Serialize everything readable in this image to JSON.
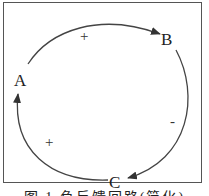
{
  "diagram": {
    "type": "causal-loop",
    "nodes": [
      {
        "id": "A",
        "label": "A"
      },
      {
        "id": "B",
        "label": "B"
      },
      {
        "id": "C",
        "label": "C"
      }
    ],
    "edges": [
      {
        "from": "A",
        "to": "B",
        "polarity": "+"
      },
      {
        "from": "B",
        "to": "C",
        "polarity": "-"
      },
      {
        "from": "C",
        "to": "A",
        "polarity": "+"
      }
    ],
    "caption": "图 1  负反馈回路(简化)"
  }
}
